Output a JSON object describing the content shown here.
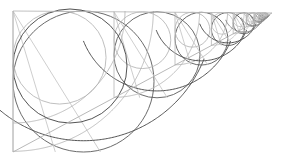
{
  "figure": {
    "type": "geometric-line-drawing",
    "width": 285,
    "height": 164,
    "background_color": "#ffffff",
    "colors": {
      "frame": "#b9b9b9",
      "hypotenuse": "#b0b0b0",
      "vertical": "#bdbdbd",
      "ray": "#c2c2c2",
      "arc_dark": "#4a4a4a",
      "arc_mid": "#7f7f7f",
      "arc_light": "#b4b4b4",
      "circle_dark": "#5a5a5a",
      "circle_mid": "#8c8c8c",
      "circle_light": "#bcbcbc"
    },
    "triangle": {
      "apex_top_left": [
        13,
        11
      ],
      "vertex_bottom_left": [
        13,
        152
      ],
      "apex_right": [
        272,
        13
      ]
    },
    "top_edge": {
      "x1": 13,
      "y1": 11,
      "x2": 272,
      "y2": 13
    },
    "left_edge": {
      "x1": 13,
      "y1": 11,
      "x2": 13,
      "y2": 152
    },
    "hypotenuse": {
      "x1": 13,
      "y1": 152,
      "x2": 272,
      "y2": 13
    },
    "stations_x": [
      13,
      114,
      175,
      212,
      234,
      248,
      256,
      262,
      266,
      269,
      271
    ],
    "scale_ratio": 0.6,
    "iterations": 10,
    "big_arc": {
      "center": [
        13,
        11
      ],
      "radius": 112,
      "start": [
        125,
        11
      ],
      "end": [
        13,
        123
      ]
    },
    "big_circle": {
      "center": [
        70,
        66
      ],
      "radius": 57
    }
  },
  "chart_data": {
    "type": "line",
    "xlabel": "",
    "ylabel": "",
    "xlim": [
      0,
      285
    ],
    "ylim": [
      164,
      0
    ],
    "grid": false,
    "legend": "none",
    "series": [
      {
        "name": "top-edge",
        "x": [
          13,
          272
        ],
        "y": [
          11,
          13
        ]
      },
      {
        "name": "left-edge",
        "x": [
          13,
          13
        ],
        "y": [
          11,
          152
        ]
      },
      {
        "name": "hypotenuse",
        "x": [
          13,
          272
        ],
        "y": [
          152,
          13
        ]
      }
    ],
    "stations": [
      {
        "index": 0,
        "x": 13,
        "scale": 1.0,
        "circle_radius": 57.0
      },
      {
        "index": 1,
        "x": 114,
        "scale": 0.6,
        "circle_radius": 34.2
      },
      {
        "index": 2,
        "x": 175,
        "scale": 0.36,
        "circle_radius": 20.5
      },
      {
        "index": 3,
        "x": 211.4,
        "scale": 0.216,
        "circle_radius": 12.3
      },
      {
        "index": 4,
        "x": 233.2,
        "scale": 0.1296,
        "circle_radius": 7.39
      },
      {
        "index": 5,
        "x": 246.3,
        "scale": 0.0778,
        "circle_radius": 4.43
      },
      {
        "index": 6,
        "x": 254.2,
        "scale": 0.0467,
        "circle_radius": 2.66
      },
      {
        "index": 7,
        "x": 258.9,
        "scale": 0.028,
        "circle_radius": 1.6
      },
      {
        "index": 8,
        "x": 261.7,
        "scale": 0.0168,
        "circle_radius": 0.96
      },
      {
        "index": 9,
        "x": 263.4,
        "scale": 0.0101,
        "circle_radius": 0.57
      }
    ]
  }
}
